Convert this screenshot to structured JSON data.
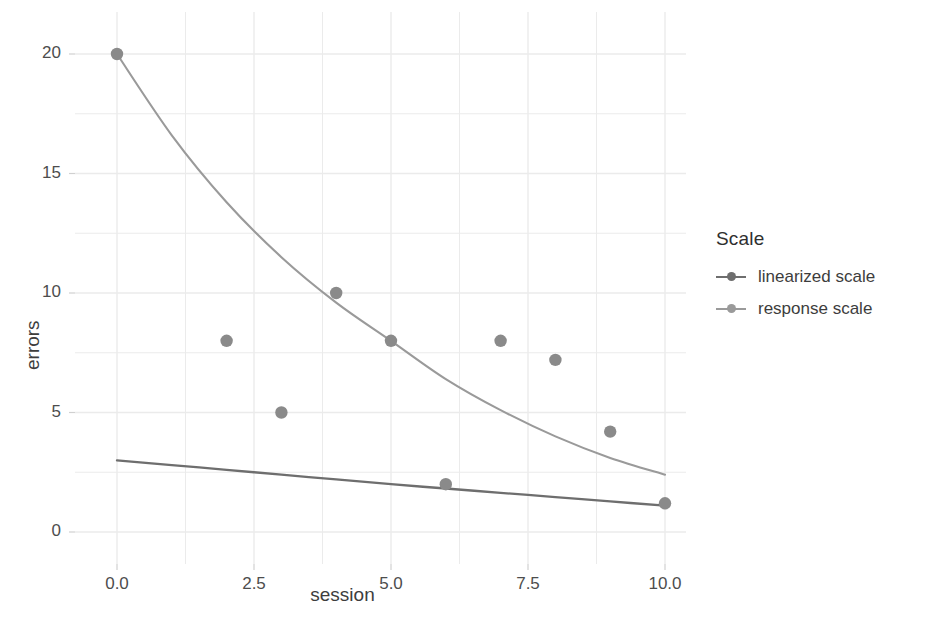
{
  "chart_data": {
    "type": "scatter",
    "title": "",
    "xlabel": "session",
    "ylabel": "errors",
    "xlim": [
      -0.5,
      10.5
    ],
    "ylim": [
      -0.7,
      21.0
    ],
    "grid": true,
    "x_ticks": [
      "0.0",
      "2.5",
      "5.0",
      "7.5",
      "10.0"
    ],
    "x_tick_values": [
      0.0,
      2.5,
      5.0,
      7.5,
      10.0
    ],
    "y_ticks": [
      "0",
      "5",
      "10",
      "15",
      "20"
    ],
    "y_tick_values": [
      0,
      5,
      10,
      15,
      20
    ],
    "points": {
      "x": [
        0,
        2,
        3,
        4,
        5,
        6,
        7,
        8,
        9,
        10
      ],
      "y": [
        20,
        8,
        5,
        10,
        8,
        2,
        8,
        7.2,
        4.2,
        1.2
      ]
    },
    "series": [
      {
        "name": "linearized scale",
        "type": "line",
        "color": "#6e6e6e",
        "x": [
          0,
          1,
          2,
          3,
          4,
          5,
          6,
          7,
          8,
          9,
          10
        ],
        "values": [
          3.0,
          2.8,
          2.6,
          2.4,
          2.2,
          2.0,
          1.82,
          1.64,
          1.46,
          1.28,
          1.1
        ]
      },
      {
        "name": "response scale",
        "type": "line",
        "color": "#9a9a9a",
        "x": [
          0,
          1,
          2,
          3,
          4,
          5,
          6,
          7,
          8,
          9,
          10
        ],
        "values": [
          20.0,
          16.6,
          13.8,
          11.5,
          9.6,
          8.0,
          6.4,
          5.1,
          4.0,
          3.1,
          2.4
        ]
      }
    ],
    "point_color": "#8a8a8a",
    "grid_color": "#ebebeb",
    "legend": {
      "title": "Scale",
      "position": "right",
      "entries": [
        {
          "label": "linearized scale",
          "color": "#6e6e6e"
        },
        {
          "label": "response scale",
          "color": "#9a9a9a"
        }
      ]
    }
  }
}
